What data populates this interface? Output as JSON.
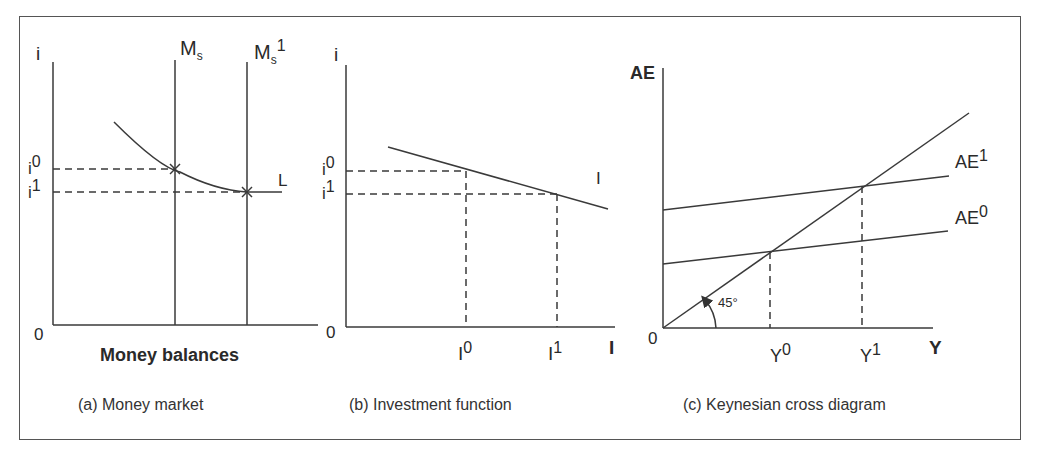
{
  "diagram": {
    "panels": [
      {
        "id": "a",
        "caption": "(a) Money market",
        "y_axis_label": "i",
        "x_axis_label": "Money balances",
        "origin_label": "0",
        "curves": [
          {
            "name": "Ms",
            "label": "M",
            "sub": "s",
            "sup": "",
            "type": "vertical"
          },
          {
            "name": "Ms1",
            "label": "M",
            "sub": "s",
            "sup": "1",
            "type": "vertical"
          },
          {
            "name": "L",
            "label": "L",
            "type": "money-demand-curve"
          }
        ],
        "y_ticks": [
          {
            "label": "i",
            "sup": "0"
          },
          {
            "label": "i",
            "sup": "1"
          }
        ]
      },
      {
        "id": "b",
        "caption": "(b) Investment function",
        "y_axis_label": "i",
        "x_axis_label": "I",
        "origin_label": "0",
        "curves": [
          {
            "name": "I",
            "label": "I",
            "type": "downward-line"
          }
        ],
        "y_ticks": [
          {
            "label": "i",
            "sup": "0"
          },
          {
            "label": "i",
            "sup": "1"
          }
        ],
        "x_ticks": [
          {
            "label": "I",
            "sup": "0"
          },
          {
            "label": "I",
            "sup": "1"
          }
        ]
      },
      {
        "id": "c",
        "caption": "(c) Keynesian cross diagram",
        "y_axis_label": "AE",
        "x_axis_label": "Y",
        "origin_label": "0",
        "angle_label": "45°",
        "curves": [
          {
            "name": "AE1",
            "label": "AE",
            "sup": "1",
            "type": "aggregate-expenditure"
          },
          {
            "name": "AE0",
            "label": "AE",
            "sup": "0",
            "type": "aggregate-expenditure"
          },
          {
            "name": "45-degree",
            "label": "",
            "type": "45-degree-line"
          }
        ],
        "x_ticks": [
          {
            "label": "Y",
            "sup": "0"
          },
          {
            "label": "Y",
            "sup": "1"
          }
        ]
      }
    ]
  }
}
